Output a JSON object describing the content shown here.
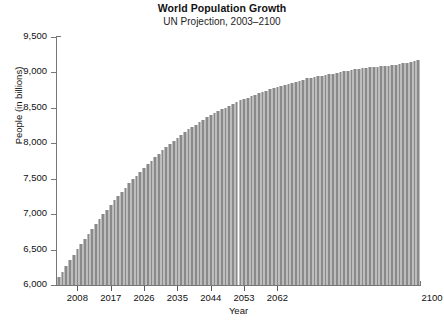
{
  "chart_data": {
    "type": "bar",
    "title": "World Population Growth",
    "subtitle": "UN Projection, 2003–2100",
    "xlabel": "Year",
    "ylabel": "People (in billions)",
    "ylim": [
      6000,
      9500
    ],
    "yticks": [
      6000,
      6500,
      7000,
      7500,
      8000,
      8500,
      9000,
      9500
    ],
    "ytick_labels": [
      "6,000",
      "6,500",
      "7,000",
      "7,500",
      "8,000",
      "8,500",
      "9,000",
      "9,500"
    ],
    "xlim": [
      2003,
      2100
    ],
    "xticks": [
      2008,
      2017,
      2026,
      2035,
      2044,
      2053,
      2062,
      2100
    ],
    "xtick_labels": [
      "2008",
      "2017",
      "2026",
      "2035",
      "2044",
      "2053",
      "2062",
      "2100"
    ],
    "grid": false,
    "legend": null,
    "bar_color": "#8a8a8a",
    "bar_edge_color": "#bdbdbd",
    "axis_color": "#767676",
    "background": "#ffffff",
    "x": [
      2003,
      2004,
      2005,
      2006,
      2007,
      2008,
      2009,
      2010,
      2011,
      2012,
      2013,
      2014,
      2015,
      2016,
      2017,
      2018,
      2019,
      2020,
      2021,
      2022,
      2023,
      2024,
      2025,
      2026,
      2027,
      2028,
      2029,
      2030,
      2031,
      2032,
      2033,
      2034,
      2035,
      2036,
      2037,
      2038,
      2039,
      2040,
      2041,
      2042,
      2043,
      2044,
      2045,
      2046,
      2047,
      2048,
      2049,
      2050,
      2051,
      2052,
      2053,
      2054,
      2055,
      2056,
      2057,
      2058,
      2059,
      2060,
      2061,
      2062,
      2063,
      2064,
      2065,
      2066,
      2067,
      2068,
      2069,
      2070,
      2071,
      2072,
      2073,
      2074,
      2075,
      2076,
      2077,
      2078,
      2079,
      2080,
      2081,
      2082,
      2083,
      2084,
      2085,
      2086,
      2087,
      2088,
      2089,
      2090,
      2091,
      2092,
      2093,
      2094,
      2095,
      2096,
      2097,
      2098,
      2099,
      2100
    ],
    "categories": [
      "2003",
      "2004",
      "2005",
      "2006",
      "2007",
      "2008",
      "2009",
      "2010",
      "2011",
      "2012",
      "2013",
      "2014",
      "2015",
      "2016",
      "2017",
      "2018",
      "2019",
      "2020",
      "2021",
      "2022",
      "2023",
      "2024",
      "2025",
      "2026",
      "2027",
      "2028",
      "2029",
      "2030",
      "2031",
      "2032",
      "2033",
      "2034",
      "2035",
      "2036",
      "2037",
      "2038",
      "2039",
      "2040",
      "2041",
      "2042",
      "2043",
      "2044",
      "2045",
      "2046",
      "2047",
      "2048",
      "2049",
      "2050",
      "2051",
      "2052",
      "2053",
      "2054",
      "2055",
      "2056",
      "2057",
      "2058",
      "2059",
      "2060",
      "2061",
      "2062",
      "2063",
      "2064",
      "2065",
      "2066",
      "2067",
      "2068",
      "2069",
      "2070",
      "2071",
      "2072",
      "2073",
      "2074",
      "2075",
      "2076",
      "2077",
      "2078",
      "2079",
      "2080",
      "2081",
      "2082",
      "2083",
      "2084",
      "2085",
      "2086",
      "2087",
      "2088",
      "2089",
      "2090",
      "2091",
      "2092",
      "2093",
      "2094",
      "2095",
      "2096",
      "2097",
      "2098",
      "2099",
      "2100"
    ],
    "values": [
      6110,
      6190,
      6270,
      6350,
      6430,
      6505,
      6580,
      6655,
      6725,
      6795,
      6865,
      6935,
      7000,
      7065,
      7130,
      7195,
      7255,
      7315,
      7375,
      7435,
      7490,
      7545,
      7600,
      7655,
      7705,
      7755,
      7805,
      7855,
      7900,
      7945,
      7990,
      8035,
      8075,
      8115,
      8155,
      8195,
      8230,
      8265,
      8300,
      8335,
      8365,
      8395,
      8425,
      8455,
      8480,
      8505,
      8530,
      8555,
      8580,
      8605,
      8625,
      8645,
      8665,
      8685,
      8705,
      8725,
      8745,
      8765,
      8780,
      8795,
      8810,
      8825,
      8840,
      8855,
      8870,
      8885,
      8900,
      8915,
      8925,
      8935,
      8945,
      8955,
      8965,
      8975,
      8985,
      8995,
      9005,
      9015,
      9025,
      9035,
      9045,
      9055,
      9060,
      9065,
      9070,
      9075,
      9080,
      9085,
      9090,
      9095,
      9100,
      9110,
      9120,
      9130,
      9140,
      9150,
      9160,
      9170
    ]
  }
}
